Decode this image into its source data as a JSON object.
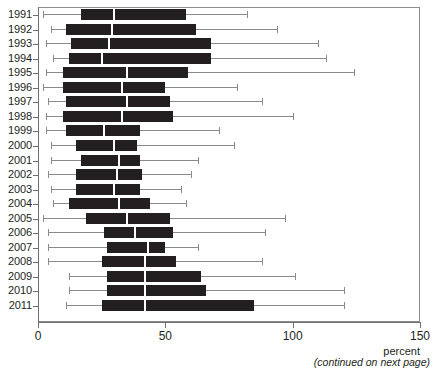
{
  "chart_data": {
    "type": "box",
    "title": "",
    "xlabel": "percent",
    "ylabel": "",
    "xlim": [
      0,
      150
    ],
    "ylim": [
      0,
      21
    ],
    "grid": false,
    "legend": null,
    "xticks": [
      0,
      50,
      100,
      150
    ],
    "xticklabels": [
      "0",
      "50",
      "100",
      "150"
    ],
    "categories": [
      "1991",
      "1992",
      "1993",
      "1994",
      "1995",
      "1996",
      "1997",
      "1998",
      "1999",
      "2000",
      "2001",
      "2002",
      "2003",
      "2004",
      "2005",
      "2006",
      "2007",
      "2008",
      "2009",
      "2010",
      "2011"
    ],
    "orientation": "horizontal",
    "boxes": [
      {
        "category": "1991",
        "whisker_low": 2,
        "q1": 17,
        "median": 30,
        "q3": 58,
        "whisker_high": 82
      },
      {
        "category": "1992",
        "whisker_low": 5,
        "q1": 11,
        "median": 29,
        "q3": 62,
        "whisker_high": 94
      },
      {
        "category": "1993",
        "whisker_low": 3,
        "q1": 13,
        "median": 28,
        "q3": 68,
        "whisker_high": 110
      },
      {
        "category": "1994",
        "whisker_low": 6,
        "q1": 12,
        "median": 25,
        "q3": 68,
        "whisker_high": 113
      },
      {
        "category": "1995",
        "whisker_low": 3,
        "q1": 10,
        "median": 35,
        "q3": 59,
        "whisker_high": 124
      },
      {
        "category": "1996",
        "whisker_low": 2,
        "q1": 10,
        "median": 33,
        "q3": 50,
        "whisker_high": 78
      },
      {
        "category": "1997",
        "whisker_low": 4,
        "q1": 11,
        "median": 35,
        "q3": 52,
        "whisker_high": 88
      },
      {
        "category": "1998",
        "whisker_low": 3,
        "q1": 10,
        "median": 33,
        "q3": 53,
        "whisker_high": 100
      },
      {
        "category": "1999",
        "whisker_low": 3,
        "q1": 11,
        "median": 26,
        "q3": 40,
        "whisker_high": 71
      },
      {
        "category": "2000",
        "whisker_low": 5,
        "q1": 15,
        "median": 30,
        "q3": 39,
        "whisker_high": 77
      },
      {
        "category": "2001",
        "whisker_low": 5,
        "q1": 17,
        "median": 32,
        "q3": 40,
        "whisker_high": 63
      },
      {
        "category": "2002",
        "whisker_low": 4,
        "q1": 15,
        "median": 31,
        "q3": 41,
        "whisker_high": 60
      },
      {
        "category": "2003",
        "whisker_low": 5,
        "q1": 15,
        "median": 30,
        "q3": 40,
        "whisker_high": 56
      },
      {
        "category": "2004",
        "whisker_low": 6,
        "q1": 12,
        "median": 32,
        "q3": 44,
        "whisker_high": 58
      },
      {
        "category": "2005",
        "whisker_low": 2,
        "q1": 19,
        "median": 35,
        "q3": 52,
        "whisker_high": 97
      },
      {
        "category": "2006",
        "whisker_low": 4,
        "q1": 26,
        "median": 38,
        "q3": 53,
        "whisker_high": 89
      },
      {
        "category": "2007",
        "whisker_low": 4,
        "q1": 27,
        "median": 43,
        "q3": 50,
        "whisker_high": 63
      },
      {
        "category": "2008",
        "whisker_low": 4,
        "q1": 25,
        "median": 42,
        "q3": 54,
        "whisker_high": 88
      },
      {
        "category": "2009",
        "whisker_low": 12,
        "q1": 27,
        "median": 42,
        "q3": 64,
        "whisker_high": 101
      },
      {
        "category": "2010",
        "whisker_low": 12,
        "q1": 27,
        "median": 42,
        "q3": 66,
        "whisker_high": 120
      },
      {
        "category": "2011",
        "whisker_low": 11,
        "q1": 25,
        "median": 42,
        "q3": 85,
        "whisker_high": 120
      }
    ]
  },
  "footer": {
    "axis_title": "percent",
    "continued_note": "(continued on next page)"
  },
  "colors": {
    "box_fill": "#231f20",
    "median_line": "#ffffff",
    "whisker": "#8a8a8a",
    "frame": "#8d8d8d",
    "text": "#231f20"
  }
}
